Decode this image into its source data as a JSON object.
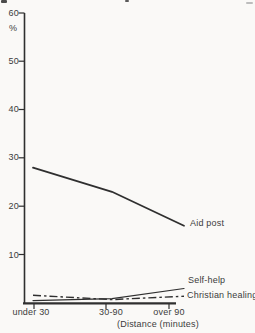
{
  "chart_data": {
    "type": "line",
    "title": "",
    "ylabel": "%",
    "xlabel": "(Distance (minutes)",
    "categories": [
      "under 30",
      "30-90",
      "over 90"
    ],
    "yticks": [
      60,
      50,
      40,
      30,
      20,
      10
    ],
    "ylim": [
      0,
      60
    ],
    "grid": false,
    "legend_position": "labels-at-right-line-ends",
    "series": [
      {
        "name": "Aid post",
        "style": "solid",
        "values": [
          28,
          23,
          16
        ]
      },
      {
        "name": "Self-help",
        "style": "solid",
        "values": [
          0.5,
          0.9,
          3
        ]
      },
      {
        "name": "Christian healing",
        "style": "dash-dot",
        "values": [
          1.6,
          0.7,
          1.4
        ]
      }
    ],
    "colors": {
      "line": "#2f2f2f",
      "text": "#3c3c3c",
      "background": "#faf9f7"
    }
  }
}
